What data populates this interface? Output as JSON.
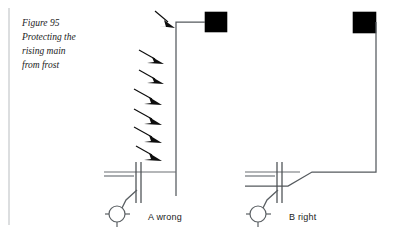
{
  "figure": {
    "caption_lines": [
      "Figure 95",
      "Protecting the",
      "rising main",
      "from frost"
    ],
    "caption_full": "Figure 95 Protecting the rising main from frost",
    "number": "95"
  },
  "colors": {
    "pipe": "#555a5e",
    "tank": "#000000",
    "arrow": "#0d0d0d",
    "ground": "#6a6f73",
    "text": "#1a1a1a",
    "frame": "#b9bdc0",
    "background": "#ffffff"
  },
  "panels": [
    {
      "id": "A",
      "letter": "A",
      "verdict": "wrong",
      "label": "A  wrong",
      "description": "Rising main run vertically up an exposed outside wall, open to frost",
      "frost_arrow_count": 7,
      "arrows_shown": true,
      "components": {
        "tank": "storage-cistern",
        "pipe": "rising-main",
        "ground": "ground-level-line",
        "fitting": "wall-union-fitting",
        "valve": "stopcock-with-lever"
      }
    },
    {
      "id": "B",
      "letter": "B",
      "verdict": "right",
      "label": "B  right",
      "description": "Rising main kept below ground then taken up inside, shielded from frost",
      "frost_arrow_count": 0,
      "arrows_shown": false,
      "components": {
        "tank": "storage-cistern",
        "pipe": "rising-main",
        "ground": "ground-level-line",
        "fitting": "wall-union-fitting",
        "valve": "stopcock-with-lever"
      }
    }
  ],
  "geometry": {
    "panel_a": {
      "tank": {
        "x": 205,
        "y": 12,
        "w": 22,
        "h": 20
      },
      "pipe_path": "M 205 22 L 176 22 L 176 196",
      "ground_y": 172,
      "ground_x1": 104,
      "ground_x2": 176,
      "fitting_x": 138,
      "valve_cx": 117,
      "valve_cy": 214,
      "valve_r": 8
    },
    "panel_b": {
      "tank": {
        "x": 353,
        "y": 12,
        "w": 23,
        "h": 21
      },
      "pipe_path": "M 376 22 L 376 172 L 312 172 L 288 186 L 245 186",
      "ground_y": 172,
      "ground_x1": 245,
      "ground_x2": 300,
      "fitting_x": 278,
      "valve_cx": 258,
      "valve_cy": 214,
      "valve_r": 8
    },
    "frost_arrows_a": [
      {
        "x1": 155,
        "y1": 11,
        "x2": 173,
        "y2": 26
      },
      {
        "x1": 139,
        "y1": 50,
        "x2": 160,
        "y2": 62
      },
      {
        "x1": 139,
        "y1": 70,
        "x2": 160,
        "y2": 82
      },
      {
        "x1": 134,
        "y1": 89,
        "x2": 158,
        "y2": 103
      },
      {
        "x1": 134,
        "y1": 109,
        "x2": 158,
        "y2": 123
      },
      {
        "x1": 134,
        "y1": 127,
        "x2": 158,
        "y2": 141
      },
      {
        "x1": 136,
        "y1": 146,
        "x2": 158,
        "y2": 159
      }
    ]
  },
  "frame": {
    "left_rule": {
      "x": 9,
      "y1": 8,
      "y2": 225
    }
  }
}
